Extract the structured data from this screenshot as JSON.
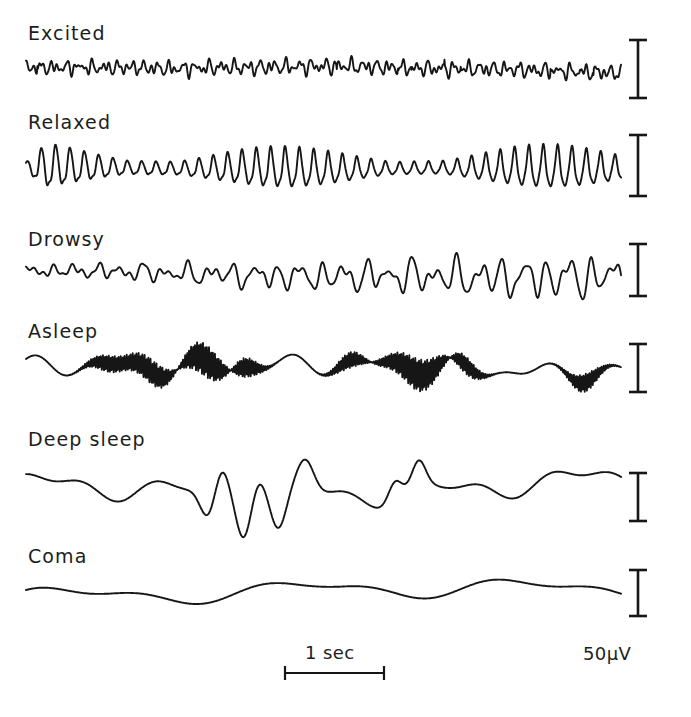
{
  "figure": {
    "background_color": "#ffffff",
    "line_color": "#161616"
  },
  "traces": [
    {
      "label": "Excited",
      "label_x": 28,
      "label_y": 22,
      "baseline_y": 70,
      "amplitude": 9,
      "description": "low-voltage fast beta activity, desynchronized"
    },
    {
      "label": "Relaxed",
      "label_x": 28,
      "label_y": 111,
      "baseline_y": 168,
      "amplitude": 26,
      "description": "regular alpha rhythm with waxing and waning spindle envelope"
    },
    {
      "label": "Drowsy",
      "label_x": 28,
      "label_y": 228,
      "baseline_y": 272,
      "amplitude": 15,
      "description": "mixed theta and alpha, irregular amplitude"
    },
    {
      "label": "Asleep",
      "label_x": 28,
      "label_y": 320,
      "baseline_y": 370,
      "amplitude": 22,
      "description": "slow waves with superimposed sleep spindles"
    },
    {
      "label": "Deep sleep",
      "label_x": 28,
      "label_y": 428,
      "baseline_y": 490,
      "amplitude": 33,
      "description": "high-voltage slow delta waves"
    },
    {
      "label": "Coma",
      "label_x": 28,
      "label_y": 545,
      "baseline_y": 595,
      "amplitude": 24,
      "description": "very slow large-amplitude delta waves"
    }
  ],
  "calibration": {
    "voltage_label": "50µV",
    "voltage_label_x": 583,
    "voltage_label_y": 643,
    "bar_x": 638,
    "cap_half_width": 9,
    "bars": [
      {
        "top": 40,
        "bottom": 98
      },
      {
        "top": 135,
        "bottom": 196
      },
      {
        "top": 244,
        "bottom": 296
      },
      {
        "top": 344,
        "bottom": 392
      },
      {
        "top": 473,
        "bottom": 521
      },
      {
        "top": 570,
        "bottom": 616
      }
    ],
    "time_label": "1 sec",
    "time_label_x": 305,
    "time_label_y": 642,
    "time_bar": {
      "x1": 285,
      "x2": 384,
      "y": 673,
      "cap_half_height": 7
    }
  },
  "chart_data": {
    "type": "line",
    "xlabel": "",
    "ylabel": "",
    "x_scale_bar": "1 sec",
    "y_scale_bar": "50µV",
    "series": [
      {
        "name": "Excited",
        "dominant_band": "beta",
        "approx_frequency_hz": 22,
        "approx_amplitude_uv": 18
      },
      {
        "name": "Relaxed",
        "dominant_band": "alpha",
        "approx_frequency_hz": 10,
        "approx_amplitude_uv": 52
      },
      {
        "name": "Drowsy",
        "dominant_band": "theta-alpha",
        "approx_frequency_hz": 7,
        "approx_amplitude_uv": 30
      },
      {
        "name": "Asleep",
        "dominant_band": "theta with spindles",
        "approx_frequency_hz": 4,
        "approx_amplitude_uv": 44
      },
      {
        "name": "Deep sleep",
        "dominant_band": "delta",
        "approx_frequency_hz": 2,
        "approx_amplitude_uv": 66
      },
      {
        "name": "Coma",
        "dominant_band": "delta",
        "approx_frequency_hz": 1,
        "approx_amplitude_uv": 48
      }
    ]
  }
}
